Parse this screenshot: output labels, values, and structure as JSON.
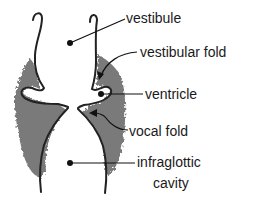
{
  "diagram": {
    "type": "anatomical-cross-section",
    "colors": {
      "outline": "#222222",
      "tissue": "#7a7a7a",
      "background": "#ffffff",
      "label": "#1a1a1a"
    },
    "labels": {
      "vestibule": "vestibule",
      "vestibular_fold": "vestibular fold",
      "ventricle": "ventricle",
      "vocal_fold": "vocal fold",
      "infraglottic_line1": "infraglottic",
      "infraglottic_line2": "cavity"
    }
  }
}
